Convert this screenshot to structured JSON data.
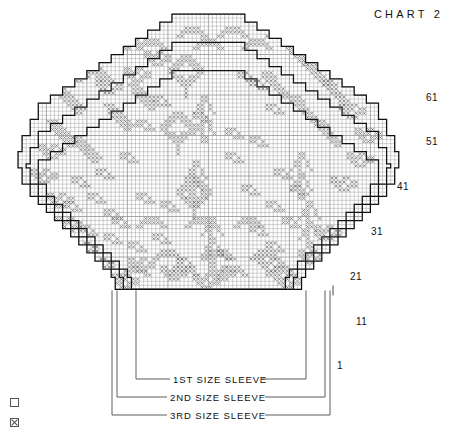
{
  "title": "CHART 2",
  "chart_data": {
    "type": "table",
    "title": "CHART 2",
    "subtitle": "",
    "xlabel": "",
    "ylabel": "",
    "grid": true,
    "cell_size_px": 4,
    "heavy_gridline_every": 10,
    "columns_total": 96,
    "rows_total": 68,
    "row_labels": [
      "61",
      "51",
      "41",
      "31",
      "21",
      "11",
      "1"
    ],
    "row_label_values": [
      61,
      51,
      41,
      31,
      21,
      11,
      1
    ],
    "row_label_y": [
      98,
      142,
      187,
      232,
      277,
      322,
      366
    ],
    "legend_position": "bottom-left",
    "legend": [
      {
        "symbol": "empty-square",
        "label": "A",
        "meaning": "background stitch"
      },
      {
        "symbol": "cross-square",
        "label": "B",
        "meaning": "contrast stitch"
      }
    ],
    "series": [
      {
        "name": "A",
        "symbol": "empty-square",
        "values": []
      },
      {
        "name": "B",
        "symbol": "cross-square",
        "values": []
      }
    ],
    "size_outlines": [
      {
        "name": "1ST SIZE SLEEVE",
        "order": 1,
        "width_cols": 44,
        "bracket_x": [
          136,
          306
        ]
      },
      {
        "name": "2ND SIZE SLEEVE",
        "order": 2,
        "width_cols": 54,
        "bracket_x": [
          117,
          325
        ]
      },
      {
        "name": "3RD SIZE SLEEVE",
        "order": 3,
        "width_cols": 58,
        "bracket_x": [
          112,
          330
        ]
      }
    ],
    "annotations": [
      "CHART 2",
      "1ST SIZE SLEEVE",
      "2ND SIZE SLEEVE",
      "3RD SIZE SLEEVE"
    ]
  },
  "row_labels": [
    {
      "text": "61",
      "top": 92,
      "left": 426
    },
    {
      "text": "51",
      "top": 136,
      "left": 426
    },
    {
      "text": "41",
      "top": 181,
      "left": 397
    },
    {
      "text": "31",
      "top": 226,
      "left": 371
    },
    {
      "text": "21",
      "top": 271,
      "left": 350
    },
    {
      "text": "11",
      "top": 316,
      "left": 356
    },
    {
      "text": "1",
      "top": 360,
      "left": 337
    }
  ],
  "size_labels": [
    {
      "text": "1ST SIZE SLEEVE",
      "top": 374,
      "left": 173
    },
    {
      "text": "2ND SIZE SLEEVE",
      "top": 392,
      "left": 170
    },
    {
      "text": "3RD SIZE SLEEVE",
      "top": 410,
      "left": 170
    }
  ],
  "legend": {
    "items": [
      {
        "label": "A",
        "symbol": "empty-square",
        "top": 398
      },
      {
        "label": "B",
        "symbol": "cross-square",
        "top": 418
      }
    ]
  }
}
